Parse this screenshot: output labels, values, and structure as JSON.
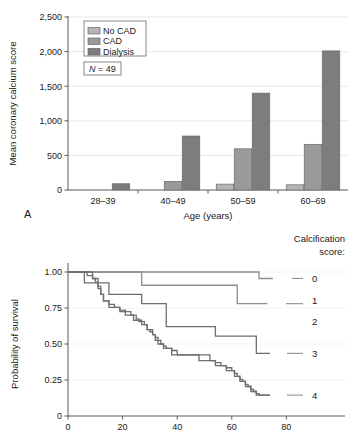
{
  "figure": {
    "panel_a_letter": "A",
    "background": "#ffffff"
  },
  "chart_data": [
    {
      "id": "panel-a",
      "type": "bar",
      "title": "",
      "xlabel": "Age (years)",
      "ylabel": "Mean coronary calcium score",
      "categories": [
        "28–39",
        "40–49",
        "50–59",
        "60–69"
      ],
      "ylim": [
        0,
        2500
      ],
      "yticks": [
        0,
        500,
        1000,
        1500,
        2000,
        2500
      ],
      "ytick_labels": [
        "0",
        "500",
        "1,000",
        "1,500",
        "2,000",
        "2,500"
      ],
      "grid": true,
      "legend_position": "top-left",
      "annotation": "N = 49",
      "annotation_italic_prefix": "N",
      "annotation_rest": " = 49",
      "series": [
        {
          "name": "No CAD",
          "color": "#b5b5b5",
          "values": [
            0,
            0,
            85,
            75
          ]
        },
        {
          "name": "CAD",
          "color": "#9a9a9a",
          "values": [
            0,
            125,
            595,
            660
          ]
        },
        {
          "name": "Dialysis",
          "color": "#7d7d7d",
          "values": [
            90,
            780,
            1400,
            2010
          ]
        }
      ]
    },
    {
      "id": "panel-b",
      "type": "line",
      "title": "",
      "xlabel": "",
      "ylabel": "Probability of survival",
      "xlim": [
        0,
        85
      ],
      "ylim": [
        0,
        1.0
      ],
      "xticks": [
        0,
        20,
        40,
        60,
        80
      ],
      "xtick_labels": [
        "0",
        "20",
        "40",
        "60",
        "80"
      ],
      "yticks": [
        0,
        0.25,
        0.5,
        0.75,
        1.0
      ],
      "ytick_labels": [
        "0",
        "0.25",
        "0.50",
        "0.75",
        "1.00"
      ],
      "grid": true,
      "legend_title_line1": "Calcification",
      "legend_title_line2": "score:",
      "legend_position": "right",
      "series": [
        {
          "name": "0",
          "color": "#8f8f8f",
          "label": "0",
          "steps": [
            [
              0,
              1.0
            ],
            [
              70,
              1.0
            ],
            [
              70,
              0.955
            ],
            [
              75,
              0.955
            ]
          ]
        },
        {
          "name": "1",
          "color": "#8f8f8f",
          "label": "1",
          "steps": [
            [
              0,
              1.0
            ],
            [
              27,
              1.0
            ],
            [
              27,
              0.908
            ],
            [
              62,
              0.908
            ],
            [
              62,
              0.78
            ],
            [
              73,
              0.78
            ]
          ]
        },
        {
          "name": "2",
          "color": "#6e6e6e",
          "label": "2",
          "steps": [
            [
              0,
              1.0
            ],
            [
              6,
              1.0
            ],
            [
              6,
              0.925
            ],
            [
              15,
              0.925
            ],
            [
              15,
              0.845
            ],
            [
              27,
              0.845
            ],
            [
              27,
              0.78
            ],
            [
              36,
              0.78
            ],
            [
              36,
              0.62
            ],
            [
              54,
              0.62
            ],
            [
              54,
              0.555
            ],
            [
              69,
              0.555
            ],
            [
              69,
              0.435
            ],
            [
              74,
              0.435
            ]
          ]
        },
        {
          "name": "3",
          "color": "#6e6e6e",
          "label": "3",
          "steps": [
            [
              0,
              1.0
            ],
            [
              9,
              1.0
            ],
            [
              9,
              0.955
            ],
            [
              11,
              0.955
            ],
            [
              11,
              0.9
            ],
            [
              12,
              0.9
            ],
            [
              12,
              0.845
            ],
            [
              13,
              0.845
            ],
            [
              13,
              0.8
            ],
            [
              15,
              0.8
            ],
            [
              15,
              0.755
            ],
            [
              19,
              0.755
            ],
            [
              19,
              0.725
            ],
            [
              21,
              0.725
            ],
            [
              21,
              0.7
            ],
            [
              24,
              0.7
            ],
            [
              24,
              0.665
            ],
            [
              27,
              0.665
            ],
            [
              27,
              0.635
            ],
            [
              29,
              0.635
            ],
            [
              29,
              0.6
            ],
            [
              31,
              0.6
            ],
            [
              31,
              0.565
            ],
            [
              32,
              0.565
            ],
            [
              32,
              0.525
            ],
            [
              33,
              0.525
            ],
            [
              33,
              0.5
            ],
            [
              35,
              0.5
            ],
            [
              35,
              0.47
            ],
            [
              38,
              0.47
            ],
            [
              38,
              0.425
            ],
            [
              48,
              0.425
            ],
            [
              48,
              0.385
            ],
            [
              54,
              0.385
            ],
            [
              54,
              0.35
            ],
            [
              58,
              0.35
            ],
            [
              58,
              0.315
            ],
            [
              61,
              0.315
            ],
            [
              61,
              0.275
            ],
            [
              63,
              0.275
            ],
            [
              63,
              0.24
            ],
            [
              65,
              0.24
            ],
            [
              65,
              0.205
            ],
            [
              67,
              0.205
            ],
            [
              67,
              0.17
            ],
            [
              69,
              0.17
            ],
            [
              69,
              0.145
            ],
            [
              74,
              0.145
            ]
          ]
        },
        {
          "name": "4",
          "color": "#6e6e6e",
          "label": "4",
          "steps": []
        }
      ],
      "curve_labels": [
        {
          "text": "0",
          "x": 81,
          "y": 0.955
        },
        {
          "text": "1",
          "x": 81,
          "y": 0.8
        },
        {
          "text": "2",
          "x": 81,
          "y": 0.655
        },
        {
          "text": "3",
          "x": 81,
          "y": 0.435
        },
        {
          "text": "4",
          "x": 81,
          "y": 0.145
        }
      ]
    }
  ]
}
